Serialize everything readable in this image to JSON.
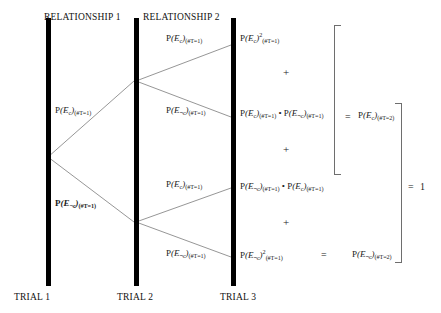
{
  "figure": {
    "headers": [
      {
        "label": "RELATIONSHIP 1",
        "x": 44,
        "y": 12
      },
      {
        "label": "RELATIONSHIP 2",
        "x": 143,
        "y": 12
      }
    ],
    "trials": [
      {
        "label": "TRIAL 1",
        "x": 14,
        "y": 292
      },
      {
        "label": "TRIAL 2",
        "x": 117,
        "y": 292
      },
      {
        "label": "TRIAL 3",
        "x": 220,
        "y": 292
      }
    ],
    "bars": [
      {
        "name": "trial-1-bar",
        "x": 46,
        "y": 18,
        "height": 268
      },
      {
        "name": "trial-2-bar",
        "x": 134,
        "y": 18,
        "height": 268
      },
      {
        "name": "trial-3-bar",
        "x": 231,
        "y": 18,
        "height": 268
      }
    ],
    "branch_labels": {
      "t1_upper": "P(E c)(#T=1)",
      "t1_lower": "P(E ~c)(#T=1)",
      "t2_a_upper": "P(E c)(#T=1)",
      "t2_a_lower": "P(E ~c)(#T=1)",
      "t2_b_upper": "P(E c)(#T=1)",
      "t2_b_lower": "P(E ~c)(#T=1)"
    },
    "outcomes": [
      "P(E c)^2 (#T=1)",
      "P(E c)(#T=1) • P(E ~c)(#T=1)",
      "P(E ~c)(#T=1) • P(E c)(#T=1)",
      "P(E ~c)^2 (#T=1)"
    ],
    "operators": {
      "plus_1": "+",
      "plus_2": "+",
      "plus_3": "+",
      "equals_top": "=",
      "equals_bottom": "=",
      "equals_final": "=",
      "final_value": "1",
      "dot": "•"
    },
    "results": [
      "P(E c)(#T=2)",
      "P(E ~c)(#T=2)"
    ],
    "symbols": {
      "P": "P",
      "E": "E",
      "sub_c": "c",
      "sub_notc": "¬ c",
      "sub_t1": "(#T=1)",
      "sub_t2": "(#T=2)",
      "sup_2": "2"
    },
    "colors": {
      "bar": "#000000",
      "line": "#8a8a8a",
      "bracket": "#6e6e6e",
      "text": "#1a1a1a",
      "background": "#ffffff"
    }
  }
}
